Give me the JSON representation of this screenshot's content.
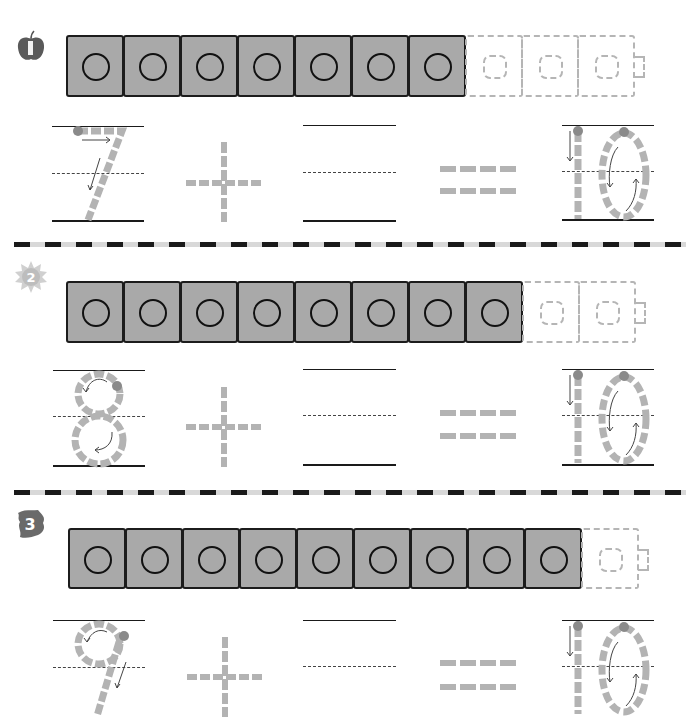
{
  "worksheet": {
    "topic": "Making 10 — addition with connecting cubes",
    "colors": {
      "cube_fill": "#a9a9a9",
      "cube_border": "#1c1c1c",
      "ghost_cube": "#b5b5b5",
      "trace_stroke": "#b3b3b3",
      "start_dot": "#8a8a8a",
      "divider_dark": "#1a1a1a",
      "divider_light": "#d8d8d8"
    },
    "problems": [
      {
        "number": "1",
        "badge_icon": "apple-icon",
        "solid_cubes": 7,
        "ghost_cubes": 3,
        "addend_one": "7",
        "operator": "+",
        "addend_two": "",
        "equals": "=",
        "sum": "10"
      },
      {
        "number": "2",
        "badge_icon": "sun-icon",
        "solid_cubes": 8,
        "ghost_cubes": 2,
        "addend_one": "8",
        "operator": "+",
        "addend_two": "",
        "equals": "=",
        "sum": "10"
      },
      {
        "number": "3",
        "badge_icon": "leaf-icon",
        "solid_cubes": 9,
        "ghost_cubes": 1,
        "addend_one": "9",
        "operator": "+",
        "addend_two": "",
        "equals": "=",
        "sum": "10"
      }
    ]
  }
}
